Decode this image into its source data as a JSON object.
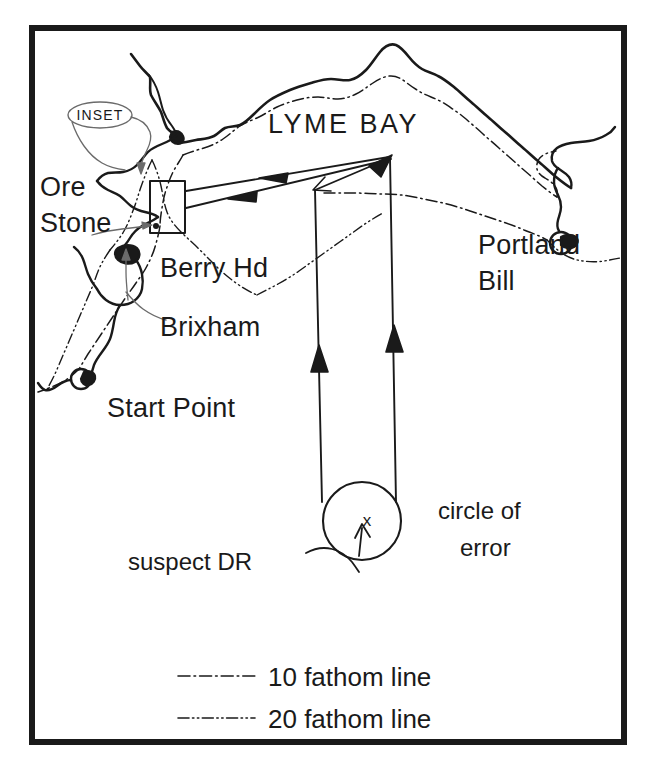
{
  "figure": {
    "type": "nautical-chart-diagram",
    "border_color": "#1a1a1a",
    "line_color": "#1a1a1a",
    "background": "#ffffff"
  },
  "labels": {
    "bay": "LYME  BAY",
    "ore_stone_line1": "Ore",
    "ore_stone_line2": "Stone",
    "berry_head": "Berry Hd",
    "brixham": "Brixham",
    "start_point": "Start Point",
    "portland_line1": "Portland",
    "portland_line2": "Bill",
    "inset": "INSET",
    "circle_of_error_line1": "circle of",
    "circle_of_error_line2": "error",
    "suspect_dr": "suspect DR",
    "dr_mark": "x"
  },
  "legend": {
    "items": [
      {
        "label": "10 fathom line",
        "pattern": "dash-dot",
        "icon": "dash-dot-line-icon"
      },
      {
        "label": "20 fathom line",
        "pattern": "dash-dot-dot",
        "icon": "dash-dot-dot-line-icon"
      }
    ]
  },
  "features": {
    "coastline_icon": "coastline-path-icon",
    "ten_fathom_icon": "ten-fathom-contour-icon",
    "twenty_fathom_icon": "twenty-fathom-contour-icon",
    "inset_box_icon": "inset-rectangle-icon",
    "error_circle_icon": "circle-of-error-icon",
    "bearing_arrow_icon": "bearing-arrow-icon",
    "track_arrow_icon": "track-arrow-icon",
    "callout_arrow_icon": "callout-arrow-icon"
  }
}
